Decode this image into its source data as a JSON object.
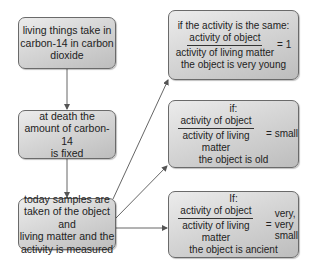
{
  "diagram": {
    "left_column": [
      {
        "id": "intake",
        "lines": [
          "living things take in",
          "carbon-14 in carbon",
          "dioxide"
        ]
      },
      {
        "id": "death",
        "lines": [
          "at death the",
          "amount of carbon-14",
          "is fixed"
        ]
      },
      {
        "id": "measure",
        "lines": [
          "today samples are",
          "taken of the object and",
          "living matter and the",
          "activity is measured"
        ]
      }
    ],
    "right_column": [
      {
        "id": "same",
        "condition": "if the activity is the same:",
        "numerator": "activity of object",
        "denominator": "activity of living matter",
        "equals": "= 1",
        "result_lines": [],
        "conclusion": "the object is very young"
      },
      {
        "id": "small",
        "condition": "if:",
        "numerator": "activity of object",
        "denominator": "activity of living matter",
        "equals": "= small",
        "result_lines": [],
        "conclusion": "the object is old"
      },
      {
        "id": "very-small",
        "condition": "If:",
        "numerator": "activity of object",
        "denominator": "activity of living matter",
        "equals": "=",
        "result_lines": [
          "very,",
          "very",
          "small"
        ],
        "conclusion": "the object is ancient"
      }
    ],
    "colors": {
      "box_border": "#6a6a6a",
      "box_fill_light": "#ececec",
      "box_fill_dark": "#bdbdbd",
      "arrow": "#555555",
      "text": "#222222"
    }
  }
}
